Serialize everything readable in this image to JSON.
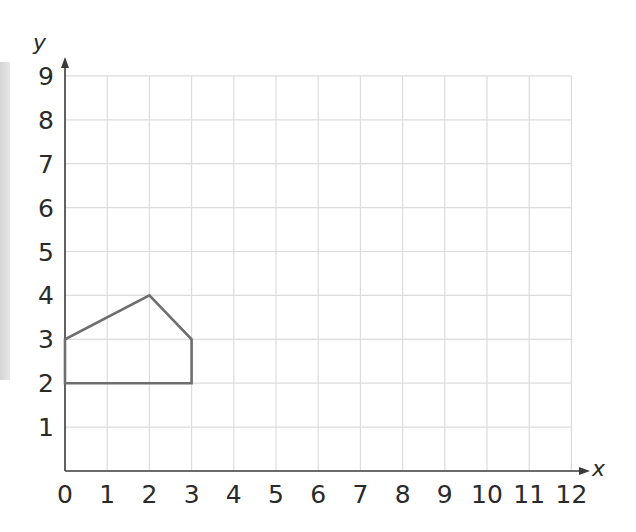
{
  "chart_data": {
    "type": "line",
    "title": "",
    "xlabel": "x",
    "ylabel": "y",
    "xlim": [
      0,
      12
    ],
    "ylim": [
      0,
      9
    ],
    "grid": true,
    "x_ticks": [
      "0",
      "1",
      "2",
      "3",
      "4",
      "5",
      "6",
      "7",
      "8",
      "9",
      "10",
      "11",
      "12"
    ],
    "y_ticks": [
      "1",
      "2",
      "3",
      "4",
      "5",
      "6",
      "7",
      "8",
      "9"
    ],
    "series": [
      {
        "name": "pentagon",
        "closed": true,
        "points": [
          [
            0,
            2
          ],
          [
            0,
            3
          ],
          [
            2,
            4
          ],
          [
            3,
            3
          ],
          [
            3,
            2
          ]
        ]
      }
    ],
    "colors": {
      "shape": "#6e6e6e",
      "axis": "#3a3a3a",
      "grid": "#dcdcdc"
    }
  }
}
